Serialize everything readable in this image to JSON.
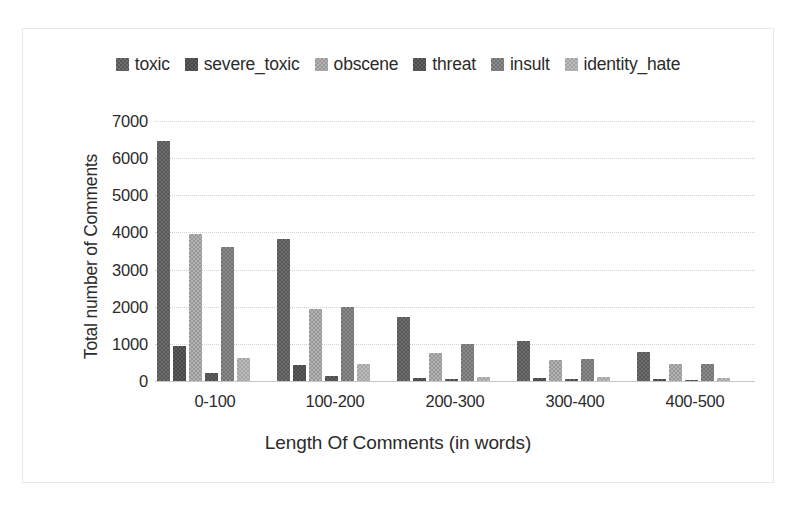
{
  "chart_data": {
    "type": "bar",
    "title": "",
    "xlabel": "Length Of Comments (in words)",
    "ylabel": "Total number of Comments",
    "categories": [
      "0-100",
      "100-200",
      "200-300",
      "300-400",
      "400-500"
    ],
    "series": [
      {
        "name": "toxic",
        "color": "#6f6f6f",
        "fill": "fill-a",
        "values": [
          6450,
          3830,
          1730,
          1080,
          780
        ]
      },
      {
        "name": "severe_toxic",
        "color": "#5d5d5d",
        "fill": "fill-b",
        "values": [
          930,
          440,
          90,
          70,
          60
        ]
      },
      {
        "name": "obscene",
        "color": "#b4b4b4",
        "fill": "fill-c",
        "values": [
          3960,
          1950,
          760,
          560,
          450
        ]
      },
      {
        "name": "threat",
        "color": "#636363",
        "fill": "fill-d",
        "values": [
          210,
          130,
          60,
          60,
          40
        ]
      },
      {
        "name": "insult",
        "color": "#8c8c8c",
        "fill": "fill-e",
        "values": [
          3620,
          2000,
          1000,
          590,
          470
        ]
      },
      {
        "name": "identity_hate",
        "color": "#bdbdbd",
        "fill": "fill-f",
        "values": [
          630,
          450,
          110,
          100,
          80
        ]
      }
    ],
    "ylim": [
      0,
      7000
    ],
    "yticks": [
      7000,
      6000,
      5000,
      4000,
      3000,
      2000,
      1000,
      0
    ],
    "ytick_labels": [
      "7000",
      "6000",
      "5000",
      "4000",
      "3000",
      "2000",
      "1000",
      "0"
    ],
    "grid": true,
    "legend_position": "top-center"
  }
}
